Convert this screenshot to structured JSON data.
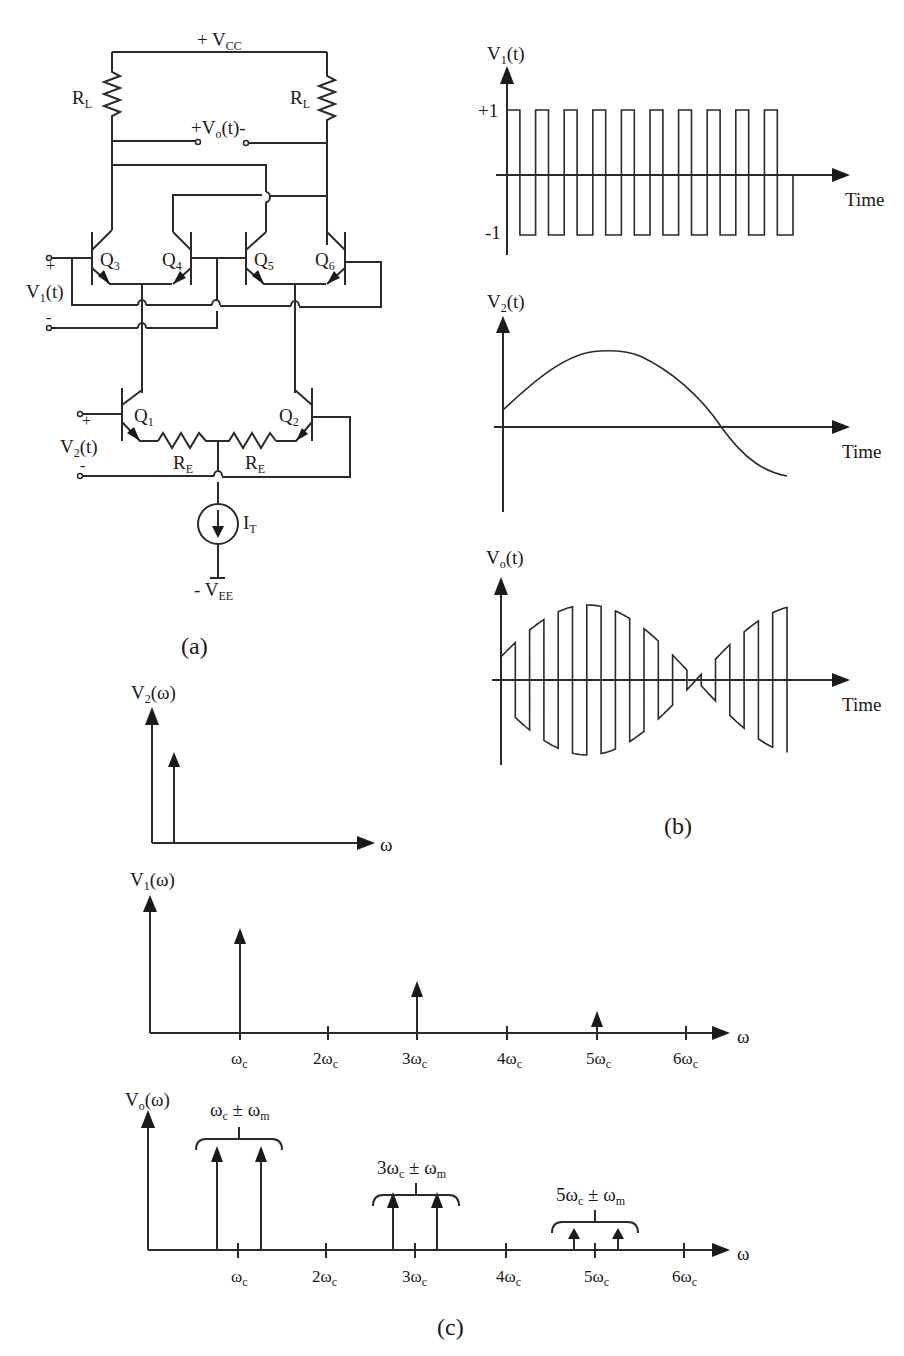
{
  "figure": {
    "captions": {
      "a": "(a)",
      "b": "(b)",
      "c": "(c)"
    }
  },
  "circuit": {
    "supply_pos": {
      "prefix": "+ V",
      "sub": "CC"
    },
    "supply_neg": {
      "prefix": "- V",
      "sub": "EE"
    },
    "load_resistor_left": {
      "main": "R",
      "sub": "L"
    },
    "load_resistor_right": {
      "main": "R",
      "sub": "L"
    },
    "output": {
      "prefix": "+V",
      "sub": "o",
      "suffix": "(t)-"
    },
    "input1": {
      "main": "V",
      "sub": "1",
      "suffix": "(t)",
      "plus": "+",
      "minus": "-"
    },
    "input2": {
      "main": "V",
      "sub": "2",
      "suffix": "(t)",
      "plus": "+",
      "minus": "-"
    },
    "transistors": [
      {
        "main": "Q",
        "sub": "3"
      },
      {
        "main": "Q",
        "sub": "4"
      },
      {
        "main": "Q",
        "sub": "5"
      },
      {
        "main": "Q",
        "sub": "6"
      },
      {
        "main": "Q",
        "sub": "1"
      },
      {
        "main": "Q",
        "sub": "2"
      }
    ],
    "emitter_resistor_left": {
      "main": "R",
      "sub": "E"
    },
    "emitter_resistor_right": {
      "main": "R",
      "sub": "E"
    },
    "current_source": {
      "main": "I",
      "sub": "T"
    }
  },
  "chart_data": [
    {
      "type": "line",
      "title": "V1(t)",
      "ylabel": {
        "main": "V",
        "sub": "1",
        "suffix": "(t)"
      },
      "xlabel": "Time",
      "y_ticks": [
        "+1",
        "-1"
      ],
      "description": "Square wave carrier alternating between +1 and -1",
      "levels": [
        1,
        -1
      ],
      "periods_shown": 10,
      "ylim": [
        -1,
        1
      ]
    },
    {
      "type": "line",
      "title": "V2(t)",
      "ylabel": {
        "main": "V",
        "sub": "2",
        "suffix": "(t)"
      },
      "xlabel": "Time",
      "description": "Low-frequency sinusoidal modulating signal, starts positive, peaks then crosses zero",
      "x": [
        0,
        0.25,
        0.5,
        0.75,
        1.0
      ],
      "y": [
        0.3,
        0.85,
        1.0,
        0.6,
        -0.6
      ]
    },
    {
      "type": "line",
      "title": "Vo(t)",
      "ylabel": {
        "main": "V",
        "sub": "o",
        "suffix": "(t)"
      },
      "xlabel": "Time",
      "description": "Product of V1(t) and V2(t): square-wave carrier with envelope following V2(t), phase reversal at zero crossing"
    },
    {
      "type": "bar",
      "title": "V2(ω)",
      "ylabel": {
        "main": "V",
        "sub": "2",
        "suffix": "(ω)"
      },
      "xlabel": "ω",
      "impulses": [
        {
          "freq": "ωm",
          "height": 0.6
        }
      ]
    },
    {
      "type": "bar",
      "title": "V1(ω)",
      "ylabel": {
        "main": "V",
        "sub": "1",
        "suffix": "(ω)"
      },
      "xlabel": "ω",
      "categories": [
        "ωc",
        "2ωc",
        "3ωc",
        "4ωc",
        "5ωc",
        "6ωc"
      ],
      "values": [
        1.0,
        0,
        0.333,
        0,
        0.2,
        0
      ],
      "tick_labels": [
        {
          "pre": "ω",
          "sub": "c"
        },
        {
          "pre": "2ω",
          "sub": "c"
        },
        {
          "pre": "3ω",
          "sub": "c"
        },
        {
          "pre": "4ω",
          "sub": "c"
        },
        {
          "pre": "5ω",
          "sub": "c"
        },
        {
          "pre": "6ω",
          "sub": "c"
        }
      ]
    },
    {
      "type": "bar",
      "title": "Vo(ω)",
      "ylabel": {
        "main": "V",
        "sub": "o",
        "suffix": "(ω)"
      },
      "xlabel": "ω",
      "categories": [
        "ωc",
        "2ωc",
        "3ωc",
        "4ωc",
        "5ωc",
        "6ωc"
      ],
      "impulse_pairs": [
        {
          "center": "ωc",
          "height": 1.0
        },
        {
          "center": "3ωc",
          "height": 0.45
        },
        {
          "center": "5ωc",
          "height": 0.18
        }
      ],
      "annotations": [
        {
          "pre": "ω",
          "sub1": "c",
          "mid": " ± ω",
          "sub2": "m"
        },
        {
          "pre": "3ω",
          "sub1": "c",
          "mid": " ± ω",
          "sub2": "m"
        },
        {
          "pre": "5ω",
          "sub1": "c",
          "mid": " ± ω",
          "sub2": "m"
        }
      ],
      "tick_labels": [
        {
          "pre": "ω",
          "sub": "c"
        },
        {
          "pre": "2ω",
          "sub": "c"
        },
        {
          "pre": "3ω",
          "sub": "c"
        },
        {
          "pre": "4ω",
          "sub": "c"
        },
        {
          "pre": "5ω",
          "sub": "c"
        },
        {
          "pre": "6ω",
          "sub": "c"
        }
      ]
    }
  ],
  "axes_labels": {
    "time": "Time",
    "omega": "ω"
  }
}
